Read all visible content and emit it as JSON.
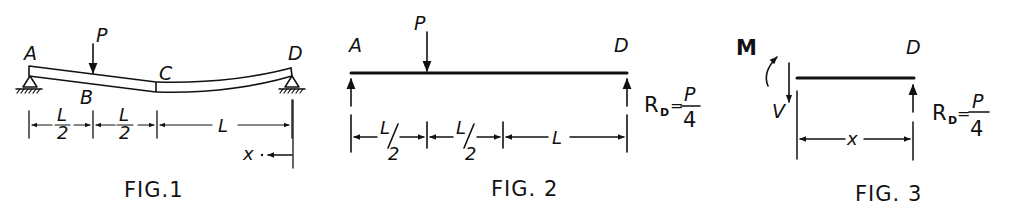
{
  "figures": [
    {
      "id": "fig1",
      "caption": "FIG.1",
      "points": {
        "A": "A",
        "B": "B",
        "C": "C",
        "D": "D"
      },
      "load": "P",
      "dimensions": [
        "L/2",
        "L/2",
        "L"
      ],
      "dim_parts": {
        "num1": "L",
        "den1": "2",
        "num2": "L",
        "den2": "2",
        "full": "L"
      },
      "coordinate": "x"
    },
    {
      "id": "fig2",
      "caption": "FIG. 2",
      "points": {
        "A": "A",
        "D": "D"
      },
      "load": "P",
      "dimensions": [
        "L/2",
        "L/2",
        "L"
      ],
      "dim_parts": {
        "num1": "L",
        "den1": "2",
        "num2": "L",
        "den2": "2",
        "full": "L"
      },
      "reaction": {
        "label": "R",
        "subscript": "D",
        "equals": "=",
        "numerator": "P",
        "denominator": "4"
      }
    },
    {
      "id": "fig3",
      "caption": "FIG. 3",
      "points": {
        "D": "D"
      },
      "moment": "M",
      "shear": "V",
      "dimension": "x",
      "reaction": {
        "label": "R",
        "subscript": "D",
        "equals": "=",
        "numerator": "P",
        "denominator": "4"
      }
    }
  ]
}
